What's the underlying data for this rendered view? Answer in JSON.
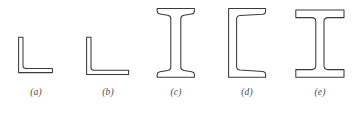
{
  "figure": {
    "type": "technical-diagram",
    "background_color": "#ffffff",
    "stroke_color": "#3a3a3a",
    "fill_color": "#ffffff",
    "caption_color": "#4a4a4a",
    "shape_count": 5,
    "shapes": [
      {
        "id": "a",
        "caption": "(a)",
        "name": "equal-leg-angle",
        "description": "Equal leg angle section (L-shape)",
        "profile": "L",
        "vertical_leg_length": 36,
        "horizontal_leg_length": 34,
        "thickness": 3.5,
        "fillet": true
      },
      {
        "id": "b",
        "caption": "(b)",
        "name": "unequal-leg-angle",
        "description": "Unequal leg angle section (L-shape, long horizontal leg)",
        "profile": "L",
        "vertical_leg_length": 38,
        "horizontal_leg_length": 42,
        "thickness": 3.5,
        "fillet": true
      },
      {
        "id": "c",
        "caption": "(c)",
        "name": "s-beam",
        "description": "American Standard beam (S-shape) with tapered flanges",
        "profile": "I",
        "depth": 72,
        "flange_width": 38,
        "flange_thickness": 5,
        "web_thickness": 7,
        "flange_taper": true
      },
      {
        "id": "d",
        "caption": "(d)",
        "name": "channel",
        "description": "American Standard channel (C-shape) with tapered flanges",
        "profile": "C",
        "depth": 72,
        "flange_width": 37,
        "flange_thickness": 5,
        "web_thickness": 5,
        "flange_taper": true
      },
      {
        "id": "e",
        "caption": "(e)",
        "name": "wide-flange-beam",
        "description": "Wide flange beam (W-shape) with parallel flanges",
        "profile": "I",
        "depth": 70,
        "flange_width": 49,
        "flange_thickness": 7,
        "web_thickness": 8,
        "flange_taper": false
      }
    ]
  }
}
